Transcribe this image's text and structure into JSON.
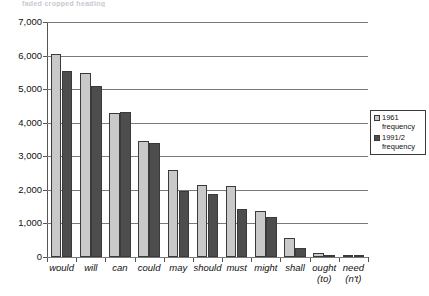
{
  "top_caption": "faded cropped heading",
  "legend": {
    "position": "right",
    "entries": [
      {
        "label": "1961\nfrequency",
        "line1": "1961",
        "line2": "frequency",
        "color": "#c9c9c9",
        "swatch": "light-gray-square"
      },
      {
        "label": "1991/2\nfrequency",
        "line1": "1991/2",
        "line2": "frequency",
        "color": "#4d4d4d",
        "swatch": "dark-gray-square"
      }
    ]
  },
  "chart_data": {
    "type": "bar",
    "title": "",
    "xlabel": "",
    "ylabel": "",
    "ylim": [
      0,
      7000
    ],
    "ytick_step": 1000,
    "grid": true,
    "grid_axis": "y",
    "orientation": "vertical",
    "grouping": "grouped",
    "categories": [
      "would",
      "will",
      "can",
      "could",
      "may",
      "should",
      "must",
      "might",
      "shall",
      "ought (to)",
      "need (n't)"
    ],
    "category_lines": [
      [
        "would"
      ],
      [
        "will"
      ],
      [
        "can"
      ],
      [
        "could"
      ],
      [
        "may"
      ],
      [
        "should"
      ],
      [
        "must"
      ],
      [
        "might"
      ],
      [
        "shall"
      ],
      [
        "ought",
        "(to)"
      ],
      [
        "need",
        "(n't)"
      ]
    ],
    "ytick_labels": [
      "0",
      "1,000",
      "2,000",
      "3,000",
      "4,000",
      "5,000",
      "6,000",
      "7,000"
    ],
    "ytick_values": [
      0,
      1000,
      2000,
      3000,
      4000,
      5000,
      6000,
      7000
    ],
    "series": [
      {
        "name": "1961 frequency",
        "color": "#c9c9c9",
        "values": [
          6050,
          5480,
          4290,
          3470,
          2590,
          2150,
          2110,
          1370,
          570,
          110,
          50
        ]
      },
      {
        "name": "1991/2 frequency",
        "color": "#4d4d4d",
        "values": [
          5540,
          5080,
          4330,
          3390,
          1960,
          1890,
          1420,
          1190,
          280,
          60,
          30
        ]
      }
    ]
  }
}
